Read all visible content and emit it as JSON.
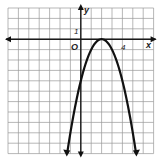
{
  "chart_data": {
    "type": "line",
    "title": "",
    "function": "y = -(x - 2)^2",
    "xlabel": "x",
    "ylabel": "y",
    "origin_label": "O",
    "tick_labels": {
      "x": [
        "4"
      ],
      "y": [
        "1"
      ]
    },
    "xlim": [
      -7,
      7
    ],
    "ylim": [
      -11,
      3
    ],
    "grid": true,
    "vertex": [
      2,
      0
    ],
    "y_intercept": [
      0,
      -4
    ],
    "series": [
      {
        "name": "parabola",
        "x": [
          -1.3,
          -1,
          0,
          1,
          2,
          3,
          4,
          5,
          5.3
        ],
        "y": [
          -10.89,
          -9,
          -4,
          -1,
          0,
          -1,
          -4,
          -9,
          -10.89
        ]
      }
    ],
    "colors": {
      "grid": "#9a9a9a",
      "axis": "#1a1a1a",
      "curve": "#111111"
    }
  },
  "labels": {
    "x_axis": "x",
    "y_axis": "y",
    "origin": "O",
    "x_tick": "4",
    "y_tick": "1"
  }
}
